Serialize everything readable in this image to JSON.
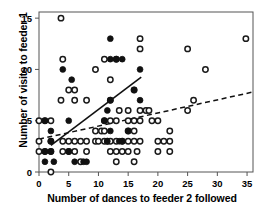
{
  "chart_data": {
    "type": "scatter",
    "title": "",
    "xlabel": "Number of dances to feeder 2 followed",
    "ylabel": "Number of visits to feeder 1",
    "xlim": [
      0,
      36
    ],
    "ylim": [
      0,
      15.6
    ],
    "xticks": [
      0,
      5,
      10,
      15,
      20,
      25,
      30,
      35
    ],
    "yticks": [
      0,
      5,
      10,
      15
    ],
    "xtick_labels": [
      "0",
      "5",
      "10",
      "15",
      "20",
      "25",
      "30",
      "35"
    ],
    "ytick_labels": [
      "0",
      "5",
      "10",
      "15"
    ],
    "grid": false,
    "legend": "none",
    "marker_colors": {
      "open": "#ffffff",
      "open_stroke": "#1a1a1a",
      "filled": "#111111",
      "axis": "#555555",
      "line": "#111111"
    },
    "series": [
      {
        "name": "open-circles",
        "marker": "open-circle",
        "points": [
          [
            0,
            5
          ],
          [
            0,
            3
          ],
          [
            0,
            2
          ],
          [
            1,
            5
          ],
          [
            1,
            2
          ],
          [
            2,
            5
          ],
          [
            2,
            3
          ],
          [
            2,
            2
          ],
          [
            2,
            0
          ],
          [
            3.7,
            15
          ],
          [
            3.7,
            7
          ],
          [
            4,
            11
          ],
          [
            4,
            3
          ],
          [
            4,
            2
          ],
          [
            5,
            8
          ],
          [
            5,
            3
          ],
          [
            5,
            2
          ],
          [
            6,
            8
          ],
          [
            6,
            7
          ],
          [
            6,
            3
          ],
          [
            6,
            2
          ],
          [
            7,
            3
          ],
          [
            7,
            1
          ],
          [
            8,
            7
          ],
          [
            8,
            3
          ],
          [
            8,
            2
          ],
          [
            9.5,
            10
          ],
          [
            9.5,
            4
          ],
          [
            9.5,
            3
          ],
          [
            10,
            3
          ],
          [
            10.5,
            4
          ],
          [
            11,
            11
          ],
          [
            11,
            5
          ],
          [
            11,
            4
          ],
          [
            11,
            3
          ],
          [
            11.5,
            3
          ],
          [
            12,
            9
          ],
          [
            12,
            7
          ],
          [
            12,
            5
          ],
          [
            12,
            3
          ],
          [
            12,
            2
          ],
          [
            13,
            11
          ],
          [
            13,
            5
          ],
          [
            13,
            3
          ],
          [
            13,
            2
          ],
          [
            13,
            1
          ],
          [
            13.5,
            6
          ],
          [
            14,
            3
          ],
          [
            14,
            2
          ],
          [
            15,
            6
          ],
          [
            15,
            5
          ],
          [
            15,
            4
          ],
          [
            15,
            3
          ],
          [
            15,
            2
          ],
          [
            16,
            8
          ],
          [
            16,
            5
          ],
          [
            16,
            4
          ],
          [
            16,
            3
          ],
          [
            16,
            1
          ],
          [
            16.5,
            2
          ],
          [
            17,
            13
          ],
          [
            17,
            12
          ],
          [
            17,
            6
          ],
          [
            17,
            5
          ],
          [
            17,
            3
          ],
          [
            18,
            6
          ],
          [
            18.5,
            6
          ],
          [
            19,
            5
          ],
          [
            20,
            5
          ],
          [
            20,
            3
          ],
          [
            20,
            2
          ],
          [
            21,
            3
          ],
          [
            22,
            4
          ],
          [
            22,
            3
          ],
          [
            22,
            2
          ],
          [
            25,
            12
          ],
          [
            25,
            6
          ],
          [
            26,
            7
          ],
          [
            28,
            10
          ],
          [
            34.8,
            13
          ]
        ]
      },
      {
        "name": "filled-circles",
        "marker": "filled-circle",
        "points": [
          [
            1,
            5
          ],
          [
            1,
            2
          ],
          [
            1,
            1
          ],
          [
            2,
            4
          ],
          [
            2,
            3
          ],
          [
            2,
            2
          ],
          [
            2.5,
            1
          ],
          [
            4,
            10
          ],
          [
            5,
            5
          ],
          [
            5,
            2
          ],
          [
            5.5,
            9
          ],
          [
            6,
            1
          ],
          [
            7.5,
            1
          ],
          [
            8,
            1
          ],
          [
            11,
            5
          ],
          [
            11.5,
            6
          ],
          [
            11.5,
            3
          ],
          [
            12,
            13
          ],
          [
            12,
            11
          ],
          [
            12,
            7
          ],
          [
            12,
            4
          ],
          [
            13,
            11
          ],
          [
            13.5,
            3
          ],
          [
            14,
            11
          ],
          [
            14,
            3
          ],
          [
            15,
            4
          ],
          [
            16,
            8
          ],
          [
            17,
            10
          ],
          [
            17,
            7
          ]
        ]
      }
    ],
    "trend_lines": [
      {
        "name": "solid-regression-filled",
        "style": "solid",
        "x0": 2.0,
        "y0": 2.6,
        "x1": 17.2,
        "y1": 9.25
      },
      {
        "name": "dashed-regression-open",
        "style": "dashed",
        "x0": 0.0,
        "y0": 3.2,
        "x1": 36.0,
        "y1": 7.8
      }
    ]
  }
}
